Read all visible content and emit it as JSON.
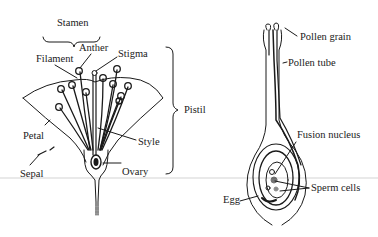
{
  "diagram": {
    "flower": {
      "labels": {
        "stamen": "Stamen",
        "anther": "Anther",
        "filament": "Filament",
        "stigma": "Stigma",
        "pistil": "Pistil",
        "petal": "Petal",
        "sepal": "Sepal",
        "style": "Style",
        "ovary": "Ovary"
      }
    },
    "pistil_detail": {
      "labels": {
        "pollen_grain": "Pollen grain",
        "pollen_tube": "Pollen tube",
        "fusion_nucleus": "Fusion nucleus",
        "sperm_cells": "Sperm cells",
        "egg": "Egg"
      }
    },
    "colors": {
      "ink": "#1a1a1a",
      "divider": "#c8c8c8"
    }
  }
}
